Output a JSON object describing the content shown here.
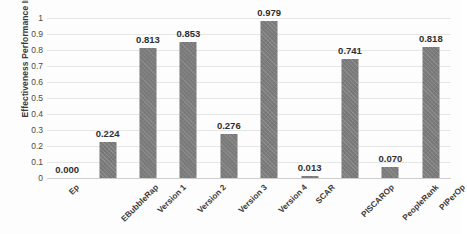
{
  "chart_data": {
    "type": "bar",
    "title": "",
    "xlabel": "",
    "ylabel": "Effectiveness Performance Index",
    "ylim": [
      0,
      1
    ],
    "ytick_labels": [
      "1",
      "0.9",
      "0.8",
      "0.7",
      "0.6",
      "0.5",
      "0.4",
      "0.3",
      "0.2",
      "0.1",
      "0"
    ],
    "ytick_values": [
      1,
      0.9,
      0.8,
      0.7,
      0.6,
      0.5,
      0.4,
      0.3,
      0.2,
      0.1,
      0
    ],
    "grid": true,
    "legend": null,
    "bar_color": "#7b7b7b",
    "categories": [
      "Ep",
      "EBubbleRap",
      "Version 1",
      "Version 2",
      "Version 3",
      "Version 4",
      "SCAR",
      "PISCAROp",
      "PeopleRank",
      "PIPerOp"
    ],
    "values": [
      0.0,
      0.224,
      0.813,
      0.853,
      0.276,
      0.979,
      0.013,
      0.741,
      0.07,
      0.818
    ],
    "data_labels": [
      "0.000",
      "0.224",
      "0.813",
      "0.853",
      "0.276",
      "0.979",
      "0.013",
      "0.741",
      "0.070",
      "0.818"
    ]
  }
}
